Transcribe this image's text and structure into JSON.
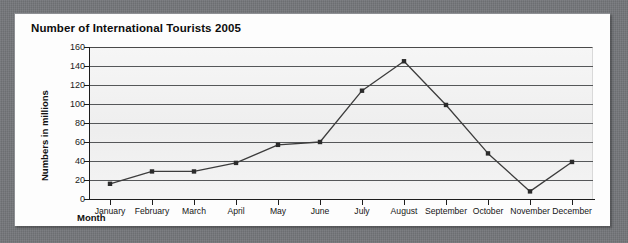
{
  "chart_data": {
    "type": "line",
    "title": "Number of International Tourists 2005",
    "xlabel": "Month",
    "ylabel": "Numbers in millions",
    "categories": [
      "January",
      "February",
      "March",
      "April",
      "May",
      "June",
      "July",
      "August",
      "September",
      "October",
      "November",
      "December"
    ],
    "values": [
      16,
      29,
      29,
      38,
      57,
      60,
      114,
      145,
      99,
      48,
      8,
      39
    ],
    "ylim": [
      0,
      160
    ],
    "ytick_labels": [
      "0",
      "20",
      "40",
      "60",
      "80",
      "100",
      "120",
      "140",
      "160"
    ],
    "ytick_values": [
      0,
      20,
      40,
      60,
      80,
      100,
      120,
      140,
      160
    ],
    "grid": true,
    "grid_axis": "y",
    "legend": false,
    "marker": "filled-square",
    "series_color": "#3c3c3c",
    "grid_color": "#555759",
    "plot_background": "#f2f2f2",
    "page_background": "#74767a",
    "card_background": "#fdfdfd"
  }
}
